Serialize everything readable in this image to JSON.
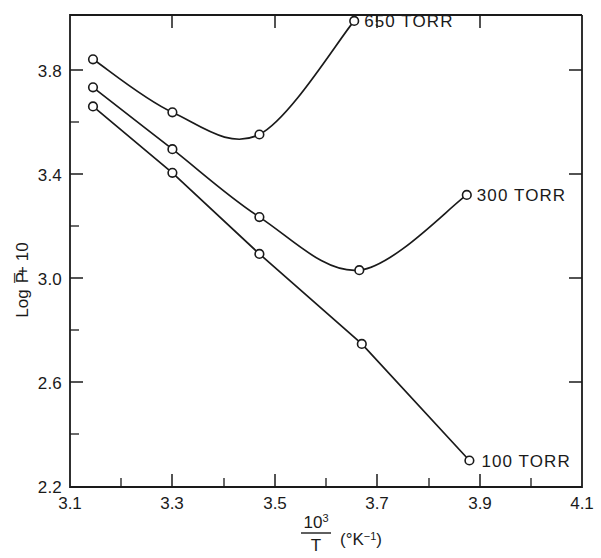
{
  "chart_data": {
    "type": "line",
    "title": "",
    "xlabel": "10³/T (°K⁻¹)",
    "ylabel": "Log P̅ + 10",
    "xlim": [
      3.1,
      4.1
    ],
    "ylim": [
      2.2,
      3.8
    ],
    "grid": false,
    "legend_position": "inline-right-of-curve-end",
    "x_ticks": [
      "3.1",
      "3.3",
      "3.5",
      "3.7",
      "3.9",
      "4.1"
    ],
    "x_tick_values": [
      3.1,
      3.3,
      3.5,
      3.7,
      3.9,
      4.1
    ],
    "x_minor_tick_values": [
      3.2,
      3.4,
      3.6,
      3.8,
      4.0
    ],
    "y_ticks": [
      "3.8",
      "3.4",
      "3.0",
      "2.6",
      "2.2"
    ],
    "y_tick_values": [
      3.8,
      3.4,
      3.0,
      2.6,
      2.2
    ],
    "y_minor_tick_values": [
      3.6,
      3.2,
      2.8,
      2.4
    ],
    "series": [
      {
        "name": "650 TORR",
        "label": "650 TORR",
        "x": [
          3.145,
          3.3,
          3.47,
          3.655
        ],
        "values": [
          3.65,
          3.47,
          3.395,
          3.78
        ]
      },
      {
        "name": "300 TORR",
        "label": "300 TORR",
        "x": [
          3.145,
          3.3,
          3.47,
          3.665,
          3.875
        ],
        "values": [
          3.555,
          3.345,
          3.115,
          2.935,
          3.19
        ]
      },
      {
        "name": "100 TORR",
        "label": "100 TORR",
        "x": [
          3.145,
          3.3,
          3.47,
          3.67,
          3.88
        ],
        "values": [
          3.49,
          3.265,
          2.99,
          2.685,
          2.29
        ]
      }
    ],
    "axis_title_fraction": {
      "numerator": "10",
      "numerator_superscript": "3",
      "denominator": "T",
      "units": "(°K⁻¹)"
    }
  }
}
